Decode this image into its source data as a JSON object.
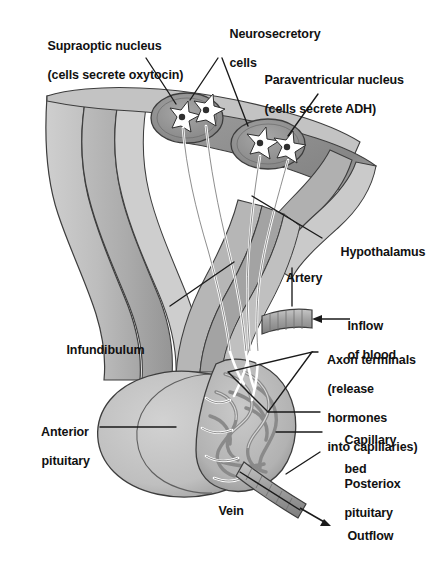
{
  "figure": {
    "background_color": "#ffffff",
    "width": 433,
    "height": 564
  },
  "palette": {
    "outline": "#3a3a3a",
    "light_gray": "#d6d6d6",
    "mid_gray": "#b9b9b9",
    "med_gray": "#a9a9a9",
    "dark_gray": "#8e8e8e",
    "darker_gray": "#7a7a7a",
    "vessel_gray": "#9c9c9c",
    "cell_white": "#ffffff",
    "cell_nucleus": "#2e2e2e",
    "label_color": "#111111"
  },
  "labels": {
    "supraoptic": {
      "line1": "Supraoptic nucleus",
      "line2": "(cells secrete oxytocin)"
    },
    "neurosecretory": {
      "line1": "Neurosecretory",
      "line2": "cells"
    },
    "paraventricular": {
      "line1": "Paraventricular nucleus",
      "line2": "(cells secrete ADH)"
    },
    "hypothalamus": {
      "line1": "Hypothalamus"
    },
    "artery": {
      "line1": "Artery"
    },
    "inflow": {
      "line1": "Inflow",
      "line2": "of blood"
    },
    "axon_terminals": {
      "line1": "Axon terminals",
      "line2": "(release",
      "line3": "hormones",
      "line4": "into capillaries)"
    },
    "capillary_bed": {
      "line1": "Capillary",
      "line2": "bed"
    },
    "posterior_pituitary": {
      "line1": "Posteriox",
      "line2": "pituitary"
    },
    "outflow": {
      "line1": "Outflow"
    },
    "vein": {
      "line1": "Vein"
    },
    "infundibulum": {
      "line1": "Infundibulum"
    },
    "anterior_pituitary": {
      "line1": "Anterior",
      "line2": "pituitary"
    }
  },
  "structures": {
    "supraoptic_nucleus_cells": 2,
    "paraventricular_nucleus_cells": 2,
    "nucleus_count": 2
  }
}
